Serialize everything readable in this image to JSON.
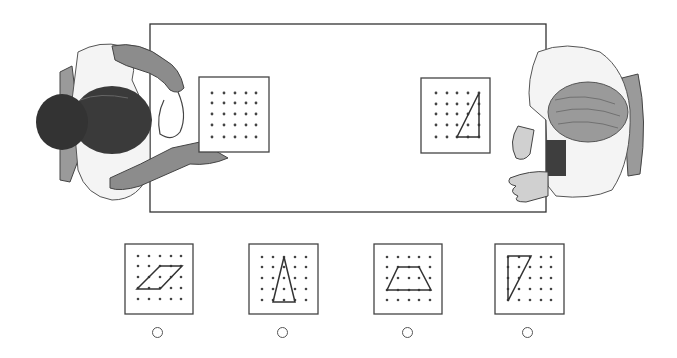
{
  "scene": {
    "description": "Two students seated at opposite ends of a table, each with a 5x5 geoboard; the right student's geoboard shows a right triangle",
    "table": {
      "x": 150,
      "y": 24,
      "w": 396,
      "h": 188
    },
    "left_board": {
      "x": 199,
      "y": 77,
      "w": 70,
      "h": 75,
      "shape": "none"
    },
    "right_board": {
      "x": 421,
      "y": 78,
      "w": 69,
      "h": 75,
      "shape": "right-triangle"
    }
  },
  "choices": [
    {
      "label": "A",
      "shape": "parallelogram",
      "selected": false
    },
    {
      "label": "B",
      "shape": "isosceles-triangle",
      "selected": false
    },
    {
      "label": "C",
      "shape": "trapezoid",
      "selected": false
    },
    {
      "label": "D",
      "shape": "right-triangle",
      "selected": false
    }
  ],
  "colors": {
    "line": "#333333",
    "dot": "#444444",
    "shade": "#8a8a8a",
    "hair_dark": "#3a3a3a",
    "hair_light": "#9a9a9a",
    "shirt": "#f4f4f4"
  }
}
